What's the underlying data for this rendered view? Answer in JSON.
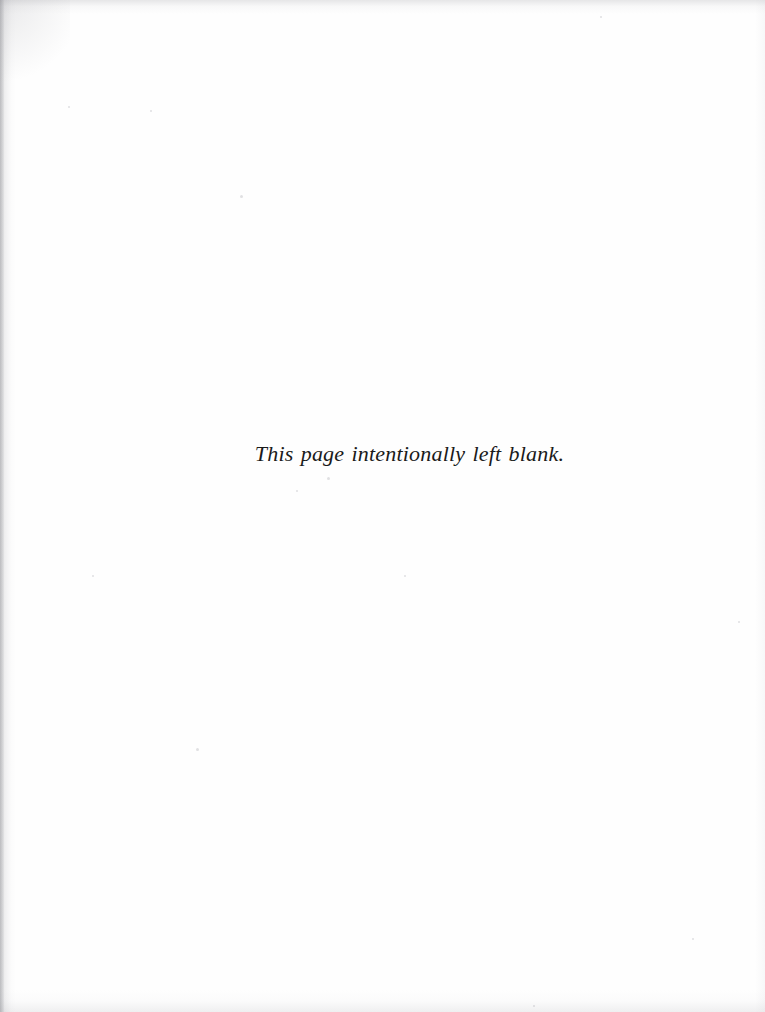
{
  "page": {
    "kind": "scanned-book-page",
    "paper_color": "#fefefe",
    "ink_color": "#1a1a1a",
    "width": 765,
    "height": 1012
  },
  "content": {
    "blank_notice": "This page intentionally left blank."
  },
  "artifacts": {
    "edge_shadow_color": "#96969c",
    "speck_color": "#787880",
    "specks": [
      {
        "x": 240,
        "y": 195,
        "size": 3
      },
      {
        "x": 327,
        "y": 477,
        "size": 3
      },
      {
        "x": 296,
        "y": 490,
        "size": 2
      },
      {
        "x": 600,
        "y": 16,
        "size": 2
      },
      {
        "x": 150,
        "y": 110,
        "size": 2
      },
      {
        "x": 196,
        "y": 748,
        "size": 3
      },
      {
        "x": 738,
        "y": 621,
        "size": 2
      },
      {
        "x": 533,
        "y": 1005,
        "size": 2
      },
      {
        "x": 692,
        "y": 938,
        "size": 2
      },
      {
        "x": 92,
        "y": 575,
        "size": 2
      },
      {
        "x": 404,
        "y": 575,
        "size": 2
      },
      {
        "x": 68,
        "y": 106,
        "size": 2
      }
    ]
  }
}
